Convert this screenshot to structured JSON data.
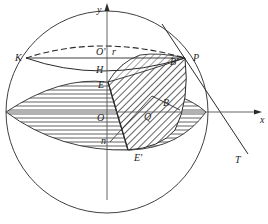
{
  "diagram": {
    "type": "sphere-geometry-figure",
    "colors": {
      "stroke": "#2a2a2a",
      "background": "#ffffff",
      "hatch": "#3a3a3a"
    },
    "axes": {
      "x_label": "x",
      "y_label": "y"
    },
    "points": {
      "K": "K",
      "O_prime": "O'",
      "r": "r",
      "H": "H",
      "E": "E",
      "P": "P",
      "B_prime": "B'",
      "B": "B",
      "O": "O",
      "Q": "Q",
      "n": "n",
      "E_prime": "E'",
      "T": "T"
    }
  }
}
